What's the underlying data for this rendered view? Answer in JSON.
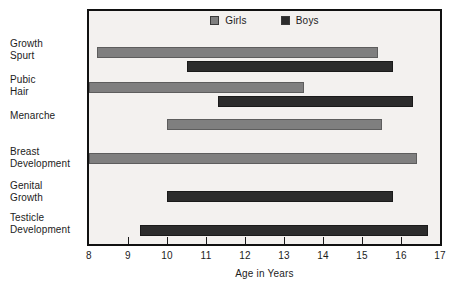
{
  "chart_data": {
    "type": "bar",
    "orientation": "horizontal",
    "title": "",
    "xlabel": "Age in Years",
    "ylabel": "",
    "xlim": [
      8,
      17
    ],
    "xticks": [
      "8",
      "9",
      "10",
      "11",
      "12",
      "13",
      "14",
      "15",
      "16",
      "17"
    ],
    "grid": false,
    "legend": {
      "position": "top-center",
      "entries": [
        {
          "name": "Girls",
          "color": "#7f7f7f"
        },
        {
          "name": "Boys",
          "color": "#2c2c2c"
        }
      ]
    },
    "categories": [
      "Growth\nSpurt",
      "Pubic\nHair",
      "Menarche",
      "Breast\nDevelopment",
      "Genital\nGrowth",
      "Testicle\nDevelopment"
    ],
    "bars": [
      {
        "category": "Growth Spurt",
        "series": "Girls",
        "start": 8.2,
        "end": 15.4
      },
      {
        "category": "Growth Spurt",
        "series": "Boys",
        "start": 10.5,
        "end": 15.8
      },
      {
        "category": "Pubic Hair",
        "series": "Girls",
        "start": 8.0,
        "end": 13.5
      },
      {
        "category": "Pubic Hair",
        "series": "Boys",
        "start": 11.3,
        "end": 16.3
      },
      {
        "category": "Menarche",
        "series": "Girls",
        "start": 10.0,
        "end": 15.5
      },
      {
        "category": "Breast Development",
        "series": "Girls",
        "start": 8.0,
        "end": 16.4
      },
      {
        "category": "Genital Growth",
        "series": "Boys",
        "start": 10.0,
        "end": 15.8
      },
      {
        "category": "Testicle Development",
        "series": "Boys",
        "start": 9.3,
        "end": 16.7
      }
    ]
  },
  "colors": {
    "girls": "#7f7f7f",
    "boys": "#2c2c2c",
    "frame": "#111111",
    "plot_background": "#f3f1ef",
    "page_background": "#ffffff",
    "text": "#1c1c1c"
  },
  "layout": {
    "category_label_tops": [
      38,
      74,
      110,
      146,
      180,
      212
    ],
    "bar_tops": [
      36,
      50,
      71,
      85,
      108,
      142,
      180,
      214
    ]
  }
}
